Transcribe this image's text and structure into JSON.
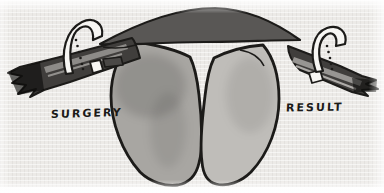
{
  "figure": {
    "labels": {
      "surgery": "SURGERY",
      "result": "RESULT"
    },
    "colors": {
      "paper": "#eceae7",
      "ink": "#1c1b19",
      "tube_arc": "#595755",
      "tube_band": "#403e3c",
      "tube_stripe_left": "#9b9995",
      "tube_stripe_right": "#a7a5a1",
      "uterus_left_horn": "#a8a6a2",
      "uterus_right_horn": "#bfbdb9",
      "clip": "#f7f6f3",
      "tab": "#4a4846"
    }
  }
}
